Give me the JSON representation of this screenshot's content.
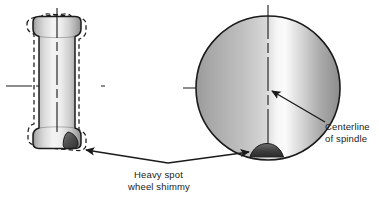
{
  "figure": {
    "background_color": "#ffffff",
    "line_color": "#1a1a1a",
    "text_color": "#222222"
  },
  "labels": {
    "heavy_spot_line1": "Heavy spot",
    "heavy_spot_line2": "wheel shimmy",
    "centerline_line1": "Centerline",
    "centerline_line2": "of spindle"
  },
  "left_view": {
    "name": "tire-side-view",
    "description": "Cylinder side view of wheel with dashed wobble outlines",
    "solid_outline_color": "#1a1a1a",
    "dashed_outline_color": "#1a1a1a",
    "gradient_light": "#f2f2f2",
    "gradient_mid": "#c9c9c9",
    "gradient_dark": "#9a9a9a",
    "heavy_spot_color": "#4a4a4a",
    "center_x": 57,
    "center_y": 86
  },
  "right_view": {
    "name": "tire-front-view",
    "description": "Circle front view of wheel with heavy spot at bottom",
    "outline_color": "#1a1a1a",
    "gradient_light": "#fafafa",
    "gradient_mid": "#c4c4c4",
    "gradient_dark": "#8e8e8e",
    "heavy_spot_color": "#4a4a4a",
    "center_x": 268,
    "center_y": 88,
    "radius": 72
  },
  "annotations": {
    "shimmy_arrow": "double-headed-arrow",
    "centerline_arrow": "single-headed-arrow"
  }
}
